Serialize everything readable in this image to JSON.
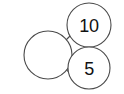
{
  "diagram": {
    "type": "number-bond",
    "background_color": "#ffffff",
    "stroke_color": "#4a4a4a",
    "text_color": "#111111",
    "nodes": [
      {
        "id": "whole",
        "role": "whole",
        "label": "",
        "filled": false,
        "cx": 48,
        "cy": 55,
        "r": 24
      },
      {
        "id": "part-top",
        "role": "part",
        "label": "10",
        "filled": true,
        "cx": 89,
        "cy": 25,
        "r": 22
      },
      {
        "id": "part-bottom",
        "role": "part",
        "label": "5",
        "filled": true,
        "cx": 89,
        "cy": 68,
        "r": 21
      }
    ],
    "links": [
      {
        "id": "link-whole-top",
        "from": "whole",
        "to": "part-top",
        "x1": 66,
        "y1": 40,
        "x2": 70,
        "y2": 36
      },
      {
        "id": "link-whole-bottom",
        "from": "whole",
        "to": "part-bottom",
        "x1": 66,
        "y1": 69,
        "x2": 71,
        "y2": 75
      }
    ]
  }
}
